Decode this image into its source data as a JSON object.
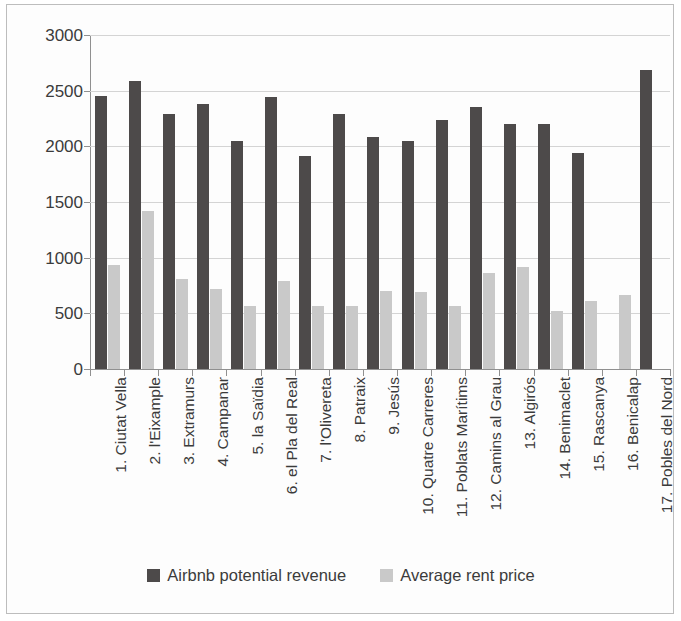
{
  "chart_data": {
    "type": "bar",
    "title": "",
    "xlabel": "",
    "ylabel": "",
    "ylim": [
      0,
      3000
    ],
    "ytick_step": 500,
    "yticks": [
      3000,
      2500,
      2000,
      1500,
      1000,
      500,
      0
    ],
    "grid": true,
    "legend_position": "bottom",
    "colors": {
      "airbnb_potential_revenue": "#4d4a4a",
      "average_rent_price": "#c9c9c9",
      "gridline": "#d4d4d4",
      "axis": "#909090",
      "text": "#3b3b3b",
      "frame_border": "#bdbdbd",
      "background": "#fdfdfd"
    },
    "categories": [
      "1. Ciutat Vella",
      "2. l'Eixample",
      "3. Extramurs",
      "4. Campanar",
      "5. la Saïdia",
      "6. el Pla del Real",
      "7. l'Olivereta",
      "8. Patraix",
      "9. Jesús",
      "10. Quatre Carreres",
      "11. Poblats Marítims",
      "12. Camins al Grau",
      "13. Algirós",
      "14. Benimaclet",
      "15. Rascanya",
      "16. Benicalap",
      "17. Pobles del Nord"
    ],
    "series": [
      {
        "name": "Airbnb potential revenue",
        "color": "#4d4a4a",
        "values": [
          2455,
          2585,
          2290,
          2380,
          2045,
          2440,
          1910,
          2295,
          2080,
          2050,
          2235,
          2355,
          2205,
          2205,
          1940,
          null,
          2690
        ]
      },
      {
        "name": "Average rent price",
        "color": "#c9c9c9",
        "values": [
          930,
          1415,
          810,
          715,
          570,
          795,
          565,
          570,
          705,
          695,
          570,
          860,
          915,
          525,
          615,
          665,
          null
        ]
      }
    ]
  },
  "legend": {
    "items": [
      {
        "label": "Airbnb potential revenue",
        "swatch": "#4d4a4a"
      },
      {
        "label": "Average rent price",
        "swatch": "#c9c9c9"
      }
    ]
  }
}
